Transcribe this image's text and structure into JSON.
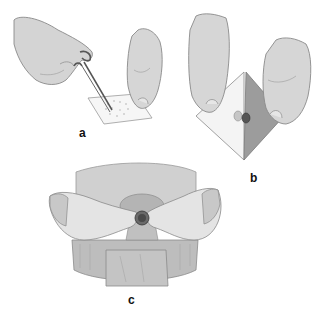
{
  "figure": {
    "panels": [
      {
        "id": "a",
        "label": "a",
        "description": "Gloved hand cutting stoma opening in skin barrier wafer with curved scissors"
      },
      {
        "id": "b",
        "label": "b",
        "description": "Two hands peeling backing paper off the adhesive wafer"
      },
      {
        "id": "c",
        "label": "c",
        "description": "Hands pressing the wafer and pouch around the stoma on the abdomen"
      }
    ],
    "colors": {
      "skin": "#d6d6d6",
      "skin_light": "#e8e8e8",
      "outline": "#8a8a8a",
      "dark": "#555555",
      "wafer_dark": "#9a9a9a",
      "stoma": "#4a4a4a"
    }
  }
}
